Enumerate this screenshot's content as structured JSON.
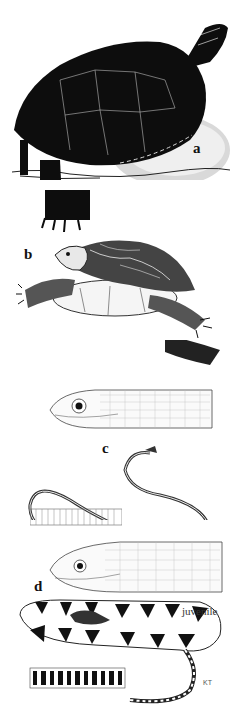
{
  "plate": {
    "figures": [
      {
        "id": "a",
        "label": "a",
        "subject": "turtle (dark carapace, basking on rock)"
      },
      {
        "id": "b",
        "label": "b",
        "subject": "turtle (patterned carapace, swimming)"
      },
      {
        "id": "c",
        "label": "c",
        "subject": "slender striped snake with head detail and ventral scales"
      },
      {
        "id": "d",
        "label": "d",
        "subject": "water snake head detail, banded juvenile, and ventral pattern"
      }
    ],
    "annotations": {
      "juvenile": "juvenile",
      "artist_initials": "KT"
    }
  },
  "colors": {
    "ink": "#0d0d0d",
    "paper": "#ffffff",
    "shade": "#8a8a8a"
  }
}
